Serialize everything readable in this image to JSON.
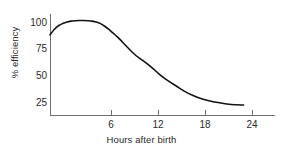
{
  "chart_data": {
    "type": "line",
    "title": "",
    "subtitle": "",
    "xlabel": "Hours after birth",
    "ylabel": "% efficiency",
    "xlim": [
      0,
      26
    ],
    "ylim": [
      18,
      105
    ],
    "grid": false,
    "legend": null,
    "x_ticks": [
      6,
      12,
      18,
      24
    ],
    "x_tick_labels": [
      "6",
      "12",
      "18",
      "24"
    ],
    "y_ticks": [
      100,
      75,
      50,
      25
    ],
    "y_tick_labels": [
      "100",
      "75",
      "50",
      "25"
    ],
    "line_color": "#121212",
    "axis_color": "#6f6f6f",
    "background": "#ffffff",
    "series": [
      {
        "name": "efficiency",
        "x": [
          0,
          0.5,
          1,
          1.5,
          2,
          2.5,
          3,
          3.5,
          4,
          4.5,
          5,
          5.5,
          6,
          6.5,
          7,
          7.5,
          8,
          9,
          10,
          11,
          12,
          13,
          14,
          15,
          16,
          17,
          18,
          19,
          20,
          21,
          22,
          23
        ],
        "values": [
          88,
          93,
          96.5,
          98.5,
          100,
          100.8,
          101.2,
          101.4,
          101.4,
          101.2,
          100.8,
          100,
          98.5,
          96,
          93,
          89.5,
          86,
          78,
          70,
          64,
          58,
          51,
          45,
          40,
          35,
          31,
          28,
          26,
          24.5,
          23.2,
          22.4,
          22.2
        ]
      }
    ],
    "annotations": []
  }
}
